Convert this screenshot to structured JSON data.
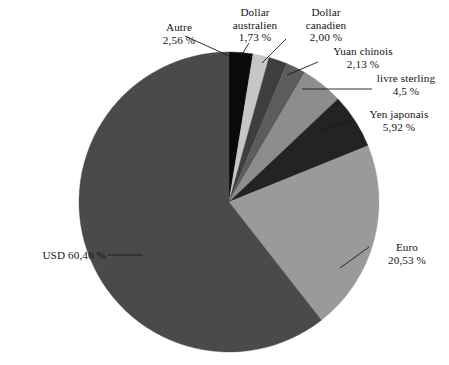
{
  "chart_data": {
    "type": "pie",
    "title": "",
    "subtitle": "",
    "xlabel": "",
    "ylabel": "",
    "legend_position": "none",
    "grid": false,
    "units": "%",
    "decimal_separator": ",",
    "start_angle_deg": 0,
    "direction": "clockwise",
    "background_color": "#ffffff",
    "categories": [
      "USD",
      "Euro",
      "Yen japonais",
      "livre sterling",
      "Yuan chinois",
      "Dollar canadien",
      "Dollar australien",
      "Autre"
    ],
    "values": [
      60.46,
      20.53,
      5.92,
      4.5,
      2.13,
      2.0,
      1.73,
      2.56
    ],
    "value_labels": [
      "60,46 %",
      "20,53 %",
      "5,92 %",
      "4,5 %",
      "2,13 %",
      "2,00 %",
      "1,73 %",
      "2,56 %"
    ],
    "colors": [
      "#4a4a4a",
      "#9a9a9a",
      "#232323",
      "#8d8d8d",
      "#5c5c5c",
      "#3e3e3e",
      "#c6c6c6",
      "#0a0a0a"
    ],
    "slices": [
      {
        "label": "Autre",
        "value": 2.56,
        "value_label": "2,56 %",
        "color": "#0a0a0a",
        "order": 1
      },
      {
        "label": "Dollar australien",
        "value": 1.73,
        "value_label": "1,73 %",
        "color": "#c6c6c6",
        "order": 2
      },
      {
        "label": "Dollar canadien",
        "value": 2.0,
        "value_label": "2,00 %",
        "color": "#3e3e3e",
        "order": 3
      },
      {
        "label": "Yuan chinois",
        "value": 2.13,
        "value_label": "2,13 %",
        "color": "#5c5c5c",
        "order": 4
      },
      {
        "label": "livre sterling",
        "value": 4.5,
        "value_label": "4,5 %",
        "color": "#8d8d8d",
        "order": 5
      },
      {
        "label": "Yen japonais",
        "value": 5.92,
        "value_label": "5,92 %",
        "color": "#232323",
        "order": 6
      },
      {
        "label": "Euro",
        "value": 20.53,
        "value_label": "20,53 %",
        "color": "#9a9a9a",
        "order": 7
      },
      {
        "label": "USD",
        "value": 60.46,
        "value_label": "60,46 %",
        "color": "#4a4a4a",
        "order": 8
      }
    ]
  },
  "labels": {
    "autre_name": "Autre",
    "autre_pct": "2,56 %",
    "aud_line1": "Dollar",
    "aud_line2": "australien",
    "aud_pct": "1,73 %",
    "cad_line1": "Dollar",
    "cad_line2": "canadien",
    "cad_pct": "2,00 %",
    "cny_name": "Yuan chinois",
    "cny_pct": "2,13 %",
    "gbp_name": "livre sterling",
    "gbp_pct": "4,5 %",
    "jpy_name": "Yen japonais",
    "jpy_pct": "5,92 %",
    "eur_name": "Euro",
    "eur_pct": "20,53 %",
    "usd_inline": "USD 60,46 %"
  }
}
